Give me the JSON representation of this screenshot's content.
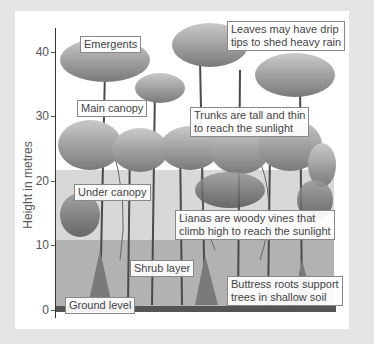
{
  "diagram": {
    "y_axis": {
      "label": "Height in metres",
      "ticks": [
        {
          "value": "40",
          "y": 52
        },
        {
          "value": "30",
          "y": 116
        },
        {
          "value": "20",
          "y": 181
        },
        {
          "value": "10",
          "y": 245
        },
        {
          "value": "0",
          "y": 310
        }
      ]
    },
    "layers": [
      {
        "label": "Emergents",
        "x": 80,
        "y": 36
      },
      {
        "label": "Main canopy",
        "x": 77,
        "y": 100
      },
      {
        "label": "Under canopy",
        "x": 74,
        "y": 184
      },
      {
        "label": "Shrub layer",
        "x": 130,
        "y": 260
      },
      {
        "label": "Ground level",
        "x": 65,
        "y": 297
      }
    ],
    "facts": [
      {
        "lines": [
          "Leaves may have drip",
          "tips to shed heavy rain"
        ],
        "x": 227,
        "y": 21
      },
      {
        "lines": [
          "Trunks are tall and thin",
          "to reach the sunlight"
        ],
        "x": 190,
        "y": 107
      },
      {
        "lines": [
          "Lianas are woody vines that",
          "climb high to reach the sunlight"
        ],
        "x": 175,
        "y": 210
      },
      {
        "lines": [
          "Buttress roots support",
          "trees in shallow soil"
        ],
        "x": 227,
        "y": 276
      }
    ]
  },
  "colors": {
    "frame": "#e4e4e4",
    "panel": "#ffffff",
    "foliage_light": "#bdbdbd",
    "foliage_dark": "#6e6e6e",
    "trunk": "#4a4a4a",
    "callout_border": "#888888",
    "text": "#444444"
  }
}
